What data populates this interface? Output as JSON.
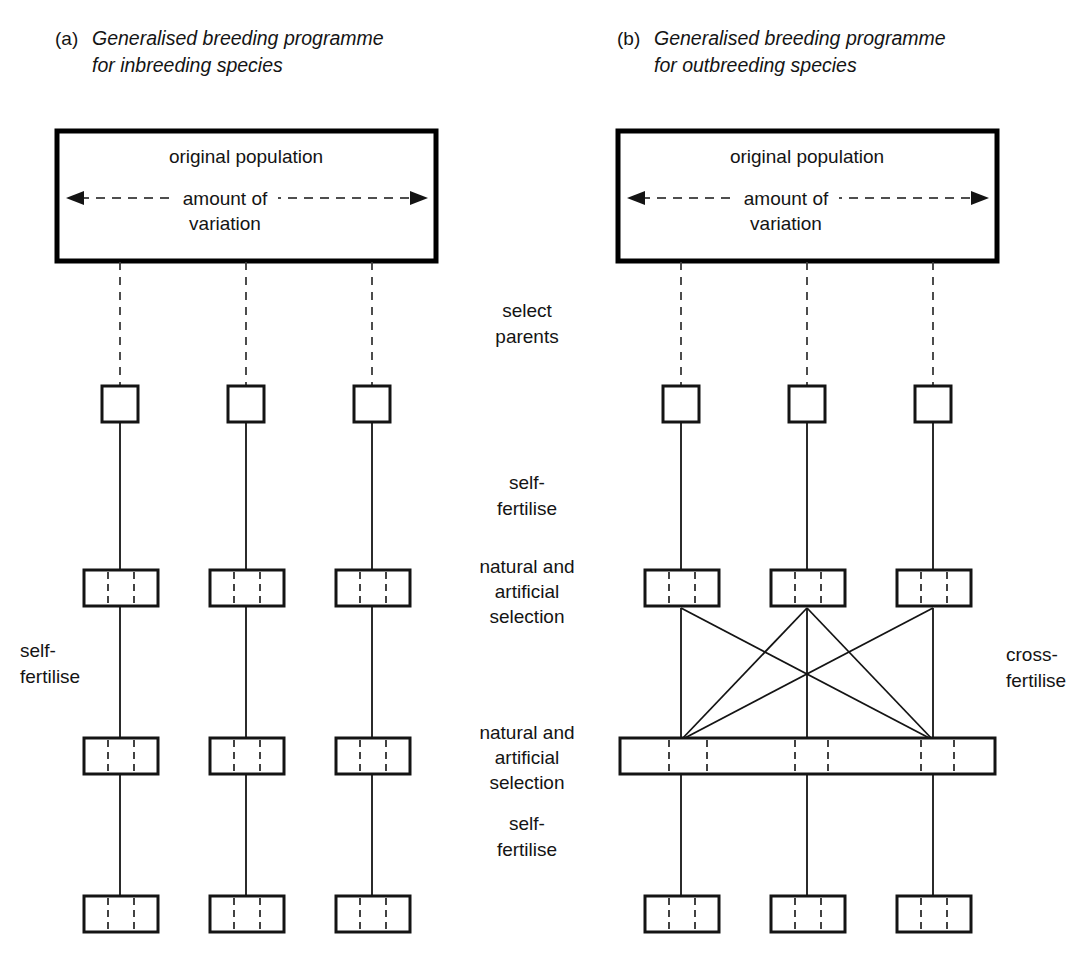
{
  "figure": {
    "background_color": "#ffffff",
    "ink_color": "#141414"
  },
  "panels": [
    {
      "id": "a",
      "marker": "(a)",
      "caption_line_1": "Generalised breeding programme",
      "caption_line_2": "for inbreeding species",
      "population_box": {
        "title": "original population",
        "variation_label_line_1": "amount of",
        "variation_label_line_2": "variation",
        "arrow_style": "dashed double-headed"
      },
      "side_label_line_1": "self-",
      "side_label_line_2": "fertilise",
      "lineages": 3,
      "rows": [
        {
          "name": "parents",
          "shape": "square",
          "count": 3
        },
        {
          "name": "generation-1",
          "shape": "segmented-rectangle",
          "count": 3,
          "segments": 3
        },
        {
          "name": "generation-2",
          "shape": "segmented-rectangle",
          "count": 3,
          "segments": 3
        },
        {
          "name": "generation-3",
          "shape": "segmented-rectangle",
          "count": 3,
          "segments": 3
        }
      ]
    },
    {
      "id": "b",
      "marker": "(b)",
      "caption_line_1": "Generalised breeding programme",
      "caption_line_2": "for outbreeding species",
      "population_box": {
        "title": "original population",
        "variation_label_line_1": "amount of",
        "variation_label_line_2": "variation",
        "arrow_style": "dashed double-headed"
      },
      "side_label_line_1": "cross-",
      "side_label_line_2": "fertilise",
      "lineages": 3,
      "rows": [
        {
          "name": "parents",
          "shape": "square",
          "count": 3
        },
        {
          "name": "generation-1",
          "shape": "segmented-rectangle",
          "count": 3,
          "segments": 3
        },
        {
          "name": "generation-2-pooled",
          "shape": "wide-segmented-bar",
          "count": 1,
          "segments": 7
        },
        {
          "name": "generation-3",
          "shape": "segmented-rectangle",
          "count": 3,
          "segments": 3
        }
      ]
    }
  ],
  "stage_labels": [
    {
      "line_1": "select",
      "line_2": "parents"
    },
    {
      "line_1": "self-",
      "line_2": "fertilise"
    },
    {
      "line_1": "natural and",
      "line_2": "artificial",
      "line_3": "selection"
    },
    {
      "line_1": "natural and",
      "line_2": "artificial",
      "line_3": "selection"
    },
    {
      "line_1": "self-",
      "line_2": "fertilise"
    }
  ]
}
